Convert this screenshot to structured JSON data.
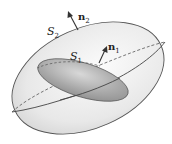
{
  "diagram": {
    "outer_surface": {
      "label": "S",
      "subscript": "2"
    },
    "inner_surface": {
      "label": "S",
      "subscript": "1"
    },
    "outer_normal": {
      "label": "n",
      "subscript": "2"
    },
    "inner_normal": {
      "label": "n",
      "subscript": "1"
    },
    "colors": {
      "outer_fill": "#eeeeee",
      "inner_fill": "#a9a9a9",
      "stroke": "#555555",
      "text": "#222222"
    }
  }
}
